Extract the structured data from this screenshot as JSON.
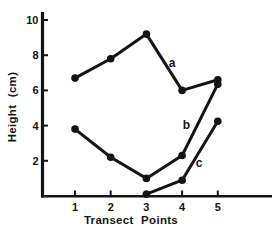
{
  "figure": {
    "background": "#ffffff",
    "ink_color": "#141414"
  },
  "chart_data": {
    "type": "line",
    "title": "",
    "xlabel": "Transect Points",
    "ylabel": "Height (cm)",
    "xticks": [
      "1",
      "2",
      "3",
      "4",
      "5"
    ],
    "xtick_values": [
      1,
      2,
      3,
      4,
      5
    ],
    "yticks": [
      "2",
      "4",
      "6",
      "8",
      "10"
    ],
    "ytick_values": [
      2,
      4,
      6,
      8,
      10
    ],
    "xlim": [
      0,
      6.5
    ],
    "ylim": [
      0,
      10.5
    ],
    "grid": false,
    "legend_position": "inline-labels",
    "marker": "filled-circle",
    "series": [
      {
        "name": "a",
        "points": [
          [
            1,
            6.7
          ],
          [
            2,
            7.8
          ],
          [
            3,
            9.2
          ],
          [
            4,
            6.0
          ],
          [
            5,
            6.6
          ]
        ],
        "label": "a",
        "label_pos": [
          3.72,
          7.55
        ]
      },
      {
        "name": "b",
        "points": [
          [
            1,
            3.8
          ],
          [
            2,
            2.2
          ],
          [
            3,
            1.0
          ],
          [
            4,
            2.3
          ],
          [
            5,
            6.35
          ]
        ],
        "label": "b",
        "label_pos": [
          4.12,
          4.05
        ]
      },
      {
        "name": "c",
        "points": [
          [
            3,
            0.1
          ],
          [
            4,
            0.9
          ],
          [
            5,
            4.25
          ]
        ],
        "label": "c",
        "label_pos": [
          4.48,
          1.9
        ]
      }
    ]
  }
}
